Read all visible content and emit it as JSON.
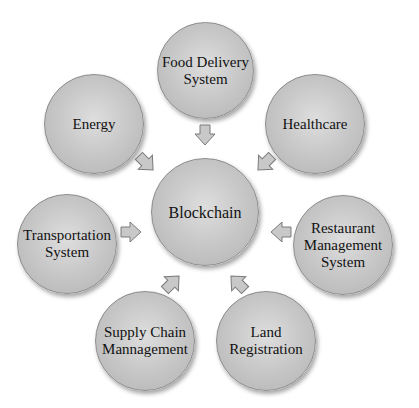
{
  "diagram": {
    "center": {
      "label": "Blockchain"
    },
    "nodes": [
      {
        "id": "food-delivery",
        "label": "Food Delivery\nSystem"
      },
      {
        "id": "energy",
        "label": "Energy"
      },
      {
        "id": "healthcare",
        "label": "Healthcare"
      },
      {
        "id": "transportation",
        "label": "Transportation\nSystem"
      },
      {
        "id": "restaurant",
        "label": "Restaurant\nManagement\nSystem"
      },
      {
        "id": "supply-chain",
        "label": "Supply Chain\nMannagement"
      },
      {
        "id": "land",
        "label": "Land\nRegistration"
      }
    ],
    "arrows": [
      {
        "from": "food-delivery",
        "to": "Blockchain",
        "direction": "down"
      },
      {
        "from": "energy",
        "to": "Blockchain",
        "direction": "down-right"
      },
      {
        "from": "healthcare",
        "to": "Blockchain",
        "direction": "down-left"
      },
      {
        "from": "transportation",
        "to": "Blockchain",
        "direction": "right"
      },
      {
        "from": "restaurant",
        "to": "Blockchain",
        "direction": "left"
      },
      {
        "from": "supply-chain",
        "to": "Blockchain",
        "direction": "up-right"
      },
      {
        "from": "land",
        "to": "Blockchain",
        "direction": "up-left"
      }
    ],
    "colors": {
      "node_fill": "#c9c9c9",
      "node_border": "#8c8c8c",
      "arrow_fill": "#c8c8c8",
      "arrow_stroke": "#7a7a7a",
      "text": "#111111"
    }
  }
}
